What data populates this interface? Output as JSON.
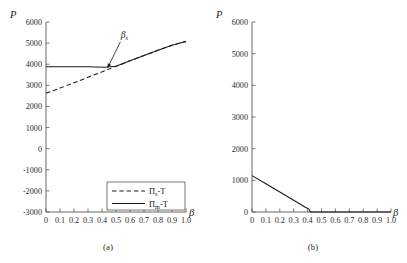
{
  "figure": {
    "panel_a_caption": "(a)",
    "panel_b_caption": "(b)",
    "y_axis_label": "P",
    "x_axis_label": "β"
  },
  "chart_data": [
    {
      "type": "line",
      "title": "(a)",
      "xlabel": "β",
      "ylabel": "P",
      "xlim": [
        0,
        1.0
      ],
      "ylim": [
        -3000,
        6000
      ],
      "grid": false,
      "legend_position": "bottom-right",
      "xticks": [
        0,
        0.1,
        0.2,
        0.3,
        0.4,
        0.5,
        0.6,
        0.7,
        0.8,
        0.9,
        1.0
      ],
      "xticklabels": [
        "0",
        "0.1",
        "0.2",
        "0.3",
        "0.4",
        "0.5",
        "0.6",
        "0.7",
        "0.8",
        "0.9",
        "1.0"
      ],
      "yticks": [
        -3000,
        -2000,
        -1000,
        0,
        1000,
        2000,
        3000,
        4000,
        5000,
        6000
      ],
      "yticklabels": [
        "-3000",
        "-2000",
        "-1000",
        "0",
        "1000",
        "2000",
        "3000",
        "4000",
        "5000",
        "6000"
      ],
      "series": [
        {
          "name": "Πs-T",
          "label_main": "Π",
          "label_sub": "s",
          "label_tail": "-T",
          "style": "dashed",
          "x": [
            0.0,
            0.1,
            0.2,
            0.3,
            0.42,
            0.5,
            0.6,
            0.7,
            0.8,
            0.9,
            1.0
          ],
          "y": [
            2620,
            2870,
            3120,
            3380,
            3690,
            3900,
            4160,
            4410,
            4660,
            4900,
            5080
          ]
        },
        {
          "name": "Πm-T",
          "label_main": "Π",
          "label_sub": "m",
          "label_tail": "-T",
          "style": "solid",
          "x": [
            0.0,
            0.1,
            0.2,
            0.3,
            0.42,
            0.5,
            0.6,
            0.7,
            0.8,
            0.9,
            1.0
          ],
          "y": [
            3880,
            3880,
            3880,
            3880,
            3860,
            3900,
            4160,
            4410,
            4660,
            4900,
            5080
          ]
        }
      ],
      "annotations": [
        {
          "text": "βs",
          "label_main": "β",
          "label_sub": "s",
          "point_x": 0.44,
          "point_y": 3830,
          "text_x": 0.56,
          "text_y": 5250
        }
      ]
    },
    {
      "type": "line",
      "title": "(b)",
      "xlabel": "β",
      "ylabel": "P",
      "xlim": [
        0,
        1.0
      ],
      "ylim": [
        0,
        6000
      ],
      "grid": false,
      "legend_position": "none",
      "xticks": [
        0,
        0.1,
        0.2,
        0.3,
        0.4,
        0.5,
        0.6,
        0.7,
        0.8,
        0.9,
        1.0
      ],
      "xticklabels": [
        "0",
        "0.1",
        "0.2",
        "0.3",
        "0.4",
        "0.5",
        "0.6",
        "0.7",
        "0.8",
        "0.9",
        "1.0"
      ],
      "yticks": [
        0,
        1000,
        2000,
        3000,
        4000,
        5000,
        6000
      ],
      "yticklabels": [
        "0",
        "1000",
        "2000",
        "3000",
        "4000",
        "5000",
        "6000"
      ],
      "series": [
        {
          "name": "P",
          "style": "solid",
          "x": [
            0.0,
            0.1,
            0.2,
            0.3,
            0.38,
            0.41,
            0.42,
            0.5,
            0.6,
            0.7,
            0.8,
            0.9,
            1.0
          ],
          "y": [
            1150,
            890,
            630,
            370,
            160,
            90,
            0,
            0,
            0,
            0,
            0,
            0,
            0
          ]
        }
      ],
      "annotations": []
    }
  ]
}
